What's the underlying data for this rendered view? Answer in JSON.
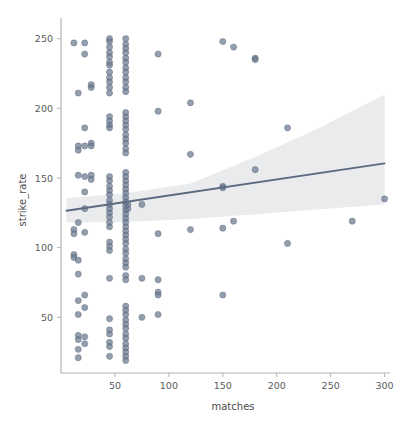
{
  "chart_data": {
    "type": "scatter",
    "title": "",
    "xlabel": "matches",
    "ylabel": "strike_rate",
    "xlim": [
      0,
      305
    ],
    "ylim": [
      10,
      262
    ],
    "xticks": [
      50,
      100,
      150,
      200,
      250,
      300
    ],
    "yticks": [
      50,
      100,
      150,
      200,
      250
    ],
    "grid": false,
    "legend": null,
    "point_color": "#6b7a8f",
    "point_edge_color": "#55627a",
    "line_color": "#5b6a80",
    "band_color": "#e9eaec",
    "axis_color": "#b0b0b0",
    "regression": {
      "x": [
        5,
        300
      ],
      "y": [
        126.5,
        160.5
      ],
      "slope": 0.115,
      "intercept": 125.9,
      "band_lower": [
        118.0,
        118.5,
        120.5,
        124.0,
        127.5,
        131.0
      ],
      "band_upper": [
        135.5,
        139.0,
        146.0,
        165.0,
        186.0,
        210.0
      ],
      "band_x": [
        5,
        60,
        120,
        180,
        240,
        300
      ]
    },
    "points": [
      [
        12,
        247
      ],
      [
        12,
        113
      ],
      [
        12,
        110
      ],
      [
        12,
        95
      ],
      [
        12,
        93
      ],
      [
        16,
        211
      ],
      [
        16,
        152
      ],
      [
        16,
        170
      ],
      [
        16,
        173
      ],
      [
        16,
        118
      ],
      [
        16,
        91
      ],
      [
        16,
        81
      ],
      [
        16,
        62
      ],
      [
        16,
        52
      ],
      [
        16,
        37
      ],
      [
        16,
        34
      ],
      [
        16,
        27
      ],
      [
        16,
        21
      ],
      [
        22,
        247
      ],
      [
        22,
        239
      ],
      [
        22,
        186
      ],
      [
        22,
        173
      ],
      [
        22,
        151
      ],
      [
        22,
        140
      ],
      [
        22,
        128
      ],
      [
        22,
        111
      ],
      [
        22,
        66
      ],
      [
        22,
        57
      ],
      [
        22,
        36
      ],
      [
        22,
        31
      ],
      [
        28,
        217
      ],
      [
        28,
        215
      ],
      [
        28,
        175
      ],
      [
        28,
        173
      ],
      [
        28,
        152
      ],
      [
        28,
        149
      ],
      [
        45,
        250
      ],
      [
        45,
        248
      ],
      [
        45,
        244
      ],
      [
        45,
        240
      ],
      [
        45,
        237
      ],
      [
        45,
        233
      ],
      [
        45,
        231
      ],
      [
        45,
        226
      ],
      [
        45,
        222
      ],
      [
        45,
        219
      ],
      [
        45,
        215
      ],
      [
        45,
        211
      ],
      [
        45,
        194
      ],
      [
        45,
        191
      ],
      [
        45,
        188
      ],
      [
        45,
        186
      ],
      [
        45,
        151
      ],
      [
        45,
        148
      ],
      [
        45,
        144
      ],
      [
        45,
        141
      ],
      [
        45,
        138
      ],
      [
        45,
        134
      ],
      [
        45,
        131
      ],
      [
        45,
        128
      ],
      [
        45,
        125
      ],
      [
        45,
        122
      ],
      [
        45,
        118
      ],
      [
        45,
        115
      ],
      [
        45,
        104
      ],
      [
        45,
        101
      ],
      [
        45,
        98
      ],
      [
        45,
        78
      ],
      [
        45,
        49
      ],
      [
        45,
        41
      ],
      [
        45,
        38
      ],
      [
        45,
        32
      ],
      [
        45,
        29
      ],
      [
        45,
        22
      ],
      [
        60,
        250
      ],
      [
        60,
        246
      ],
      [
        60,
        243
      ],
      [
        60,
        240
      ],
      [
        60,
        236
      ],
      [
        60,
        233
      ],
      [
        60,
        229
      ],
      [
        60,
        226
      ],
      [
        60,
        222
      ],
      [
        60,
        219
      ],
      [
        60,
        215
      ],
      [
        60,
        212
      ],
      [
        60,
        197
      ],
      [
        60,
        194
      ],
      [
        60,
        191
      ],
      [
        60,
        188
      ],
      [
        60,
        185
      ],
      [
        60,
        181
      ],
      [
        60,
        178
      ],
      [
        60,
        175
      ],
      [
        60,
        171
      ],
      [
        60,
        168
      ],
      [
        60,
        154
      ],
      [
        60,
        151
      ],
      [
        60,
        148
      ],
      [
        60,
        145
      ],
      [
        60,
        142
      ],
      [
        60,
        139
      ],
      [
        60,
        136
      ],
      [
        60,
        133
      ],
      [
        60,
        130
      ],
      [
        60,
        127
      ],
      [
        60,
        124
      ],
      [
        60,
        121
      ],
      [
        60,
        118
      ],
      [
        60,
        115
      ],
      [
        60,
        112
      ],
      [
        60,
        109
      ],
      [
        60,
        106
      ],
      [
        60,
        103
      ],
      [
        60,
        99
      ],
      [
        60,
        96
      ],
      [
        60,
        92
      ],
      [
        60,
        89
      ],
      [
        60,
        86
      ],
      [
        60,
        80
      ],
      [
        60,
        77
      ],
      [
        60,
        58
      ],
      [
        60,
        55
      ],
      [
        60,
        52
      ],
      [
        60,
        48
      ],
      [
        60,
        45
      ],
      [
        60,
        42
      ],
      [
        60,
        38
      ],
      [
        60,
        35
      ],
      [
        60,
        31
      ],
      [
        60,
        28
      ],
      [
        60,
        25
      ],
      [
        60,
        22
      ],
      [
        60,
        19
      ],
      [
        62,
        131
      ],
      [
        62,
        128
      ],
      [
        75,
        131
      ],
      [
        75,
        78
      ],
      [
        75,
        50
      ],
      [
        90,
        239
      ],
      [
        90,
        198
      ],
      [
        90,
        110
      ],
      [
        90,
        77
      ],
      [
        90,
        68
      ],
      [
        90,
        66
      ],
      [
        90,
        52
      ],
      [
        120,
        204
      ],
      [
        120,
        167
      ],
      [
        120,
        113
      ],
      [
        150,
        248
      ],
      [
        150,
        144
      ],
      [
        150,
        143
      ],
      [
        150,
        114
      ],
      [
        150,
        66
      ],
      [
        160,
        244
      ],
      [
        160,
        119
      ],
      [
        180,
        236
      ],
      [
        180,
        235
      ],
      [
        180,
        156
      ],
      [
        210,
        186
      ],
      [
        210,
        103
      ],
      [
        270,
        119
      ],
      [
        300,
        135
      ]
    ]
  }
}
